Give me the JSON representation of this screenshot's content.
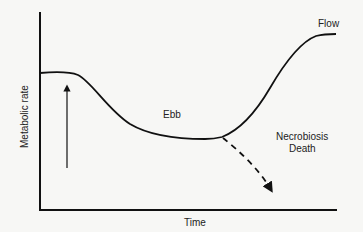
{
  "diagram": {
    "axes": {
      "ylabel": "Metabolic rate",
      "xlabel": "Time"
    },
    "labels": {
      "ebb": "Ebb",
      "flow": "Flow",
      "necrobiosis": "Necrobiosis",
      "death": "Death"
    },
    "curve_phases": [
      "baseline",
      "ebb",
      "flow"
    ],
    "branches": [
      {
        "name": "recovery",
        "to": "Flow",
        "style": "solid"
      },
      {
        "name": "failure",
        "to": "Necrobiosis / Death",
        "style": "dashed"
      }
    ],
    "markers": {
      "injury_arrow": "upward arrow indicating injury"
    },
    "colors": {
      "line": "#111111",
      "background": "#f7f7f5"
    }
  }
}
